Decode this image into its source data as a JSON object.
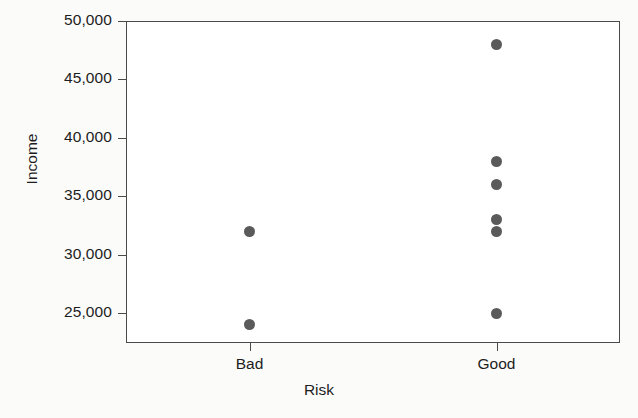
{
  "chart_data": {
    "type": "scatter",
    "title": "",
    "xlabel": "Risk",
    "ylabel": "Income",
    "categories": [
      "Bad",
      "Good"
    ],
    "ytick_labels": [
      "50,000",
      "45,000",
      "40,000",
      "35,000",
      "30,000",
      "25,000"
    ],
    "ytick_values": [
      50000,
      45000,
      40000,
      35000,
      30000,
      25000
    ],
    "ylim": [
      23200,
      50000
    ],
    "grid": false,
    "legend": null,
    "marker_color": "#5a5a5a",
    "axis_color": "#4a4a4a",
    "background_color": "#fbfbfa",
    "points": [
      {
        "category": "Bad",
        "income": 32000
      },
      {
        "category": "Bad",
        "income": 24000
      },
      {
        "category": "Good",
        "income": 48000
      },
      {
        "category": "Good",
        "income": 38000
      },
      {
        "category": "Good",
        "income": 36000
      },
      {
        "category": "Good",
        "income": 33000
      },
      {
        "category": "Good",
        "income": 32000
      },
      {
        "category": "Good",
        "income": 25000
      }
    ]
  }
}
